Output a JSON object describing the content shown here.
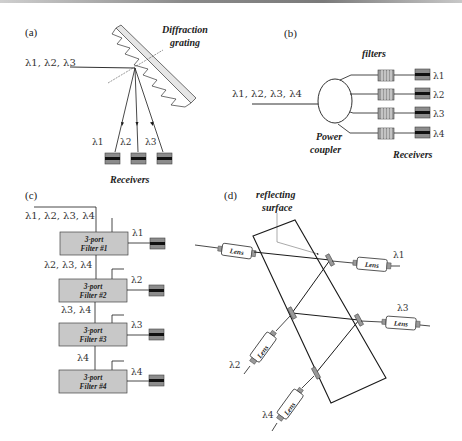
{
  "figure": {
    "panels": {
      "a": {
        "label": "(a)",
        "input_label": "λ1, λ2, λ3",
        "element_label_line1": "Diffraction",
        "element_label_line2": "grating",
        "output_labels": [
          "λ1",
          "λ2",
          "λ3"
        ],
        "receivers_label": "Receivers"
      },
      "b": {
        "label": "(b)",
        "input_label": "λ1, λ2, λ3, λ4",
        "filters_label": "filters",
        "coupler_label_line1": "Power",
        "coupler_label_line2": "coupler",
        "output_labels": [
          "λ1",
          "λ2",
          "λ3",
          "λ4"
        ],
        "receivers_label": "Receivers"
      },
      "c": {
        "label": "(c)",
        "input_label": "λ1, λ2, λ3, λ4",
        "filters": [
          {
            "line1": "3-port",
            "line2": "Filter #1",
            "drop": "λ1",
            "pass": "λ2, λ3, λ4"
          },
          {
            "line1": "3-port",
            "line2": "Filter #2",
            "drop": "λ2",
            "pass": "λ3, λ4"
          },
          {
            "line1": "3-port",
            "line2": "Filter #3",
            "drop": "λ3",
            "pass": "λ4"
          },
          {
            "line1": "3-port",
            "line2": "Filter #4",
            "drop": "λ4",
            "pass": ""
          }
        ]
      },
      "d": {
        "label": "(d)",
        "surface_label_line1": "reflecting",
        "surface_label_line2": "surface",
        "lens_label": "Lens",
        "output_labels": [
          "λ1",
          "λ2",
          "λ3",
          "λ4"
        ]
      }
    },
    "colors": {
      "line": "#1a1a1a",
      "filter_box": "#c8c8c8",
      "receiver_body": "#8c8c8c",
      "receiver_stripe": "#111111",
      "grating_fill": "#e6e6e6"
    }
  }
}
